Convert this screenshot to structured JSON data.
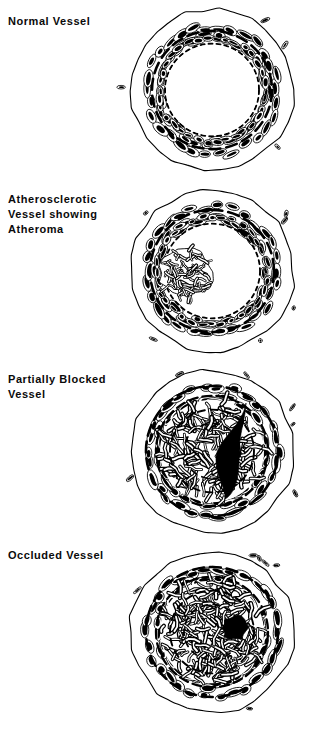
{
  "figure": {
    "title_present": false,
    "background_color": "#ffffff",
    "ink_color": "#000000",
    "width": 309,
    "height": 729,
    "style": "black-and-white line drawing, medical cross-section illustration"
  },
  "panels": [
    {
      "id": "normal-vessel",
      "label": "Normal Vessel",
      "label_lines": [
        "Normal Vessel"
      ],
      "lumen_state": "wide open",
      "lumen_fill": "#ffffff",
      "occlusion_percent": 0,
      "center": [
        212,
        90
      ],
      "outer_radius": 82,
      "media_radius": 68,
      "elastic_lamina_radius": 52,
      "lumen_radius": 46
    },
    {
      "id": "atherosclerotic-vessel",
      "label": "Atherosclerotic Vessel showing Atheroma",
      "label_lines": [
        "Atherosclerotic",
        "Vessel showing",
        "Atheroma"
      ],
      "lumen_state": "narrowed by plaque on left side",
      "lumen_fill": "#ffffff",
      "occlusion_percent": 35,
      "center": [
        212,
        271
      ],
      "outer_radius": 82,
      "media_radius": 68,
      "elastic_lamina_radius": 54,
      "lumen_radius": 46,
      "plaque_side": "left"
    },
    {
      "id": "partially-blocked-vessel",
      "label": "Partially Blocked Vessel",
      "label_lines": [
        "Partially Blocked",
        "Vessel"
      ],
      "lumen_state": "narrow crescent channel on right",
      "lumen_fill": "#000000",
      "occlusion_percent": 85,
      "center": [
        212,
        451
      ],
      "outer_radius": 82,
      "media_radius": 68,
      "elastic_lamina_radius": 58,
      "lumen_radius": 0,
      "plaque_side": "concentric, eccentric to left"
    },
    {
      "id": "occluded-vessel",
      "label": "Occluded Vessel",
      "label_lines": [
        "Occluded Vessel"
      ],
      "lumen_state": "residual pinpoint channel",
      "lumen_fill": "#000000",
      "occlusion_percent": 98,
      "center": [
        212,
        632
      ],
      "outer_radius": 82,
      "media_radius": 68,
      "elastic_lamina_radius": 58,
      "lumen_radius": 0
    }
  ],
  "legend": {
    "present": false
  }
}
